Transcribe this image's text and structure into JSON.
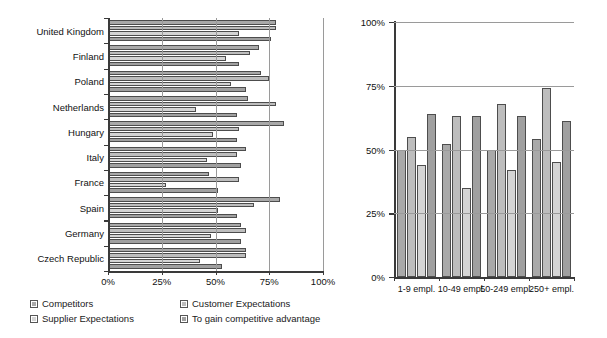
{
  "colors": {
    "series1": "#a9a9a9",
    "series2": "#bdbdbd",
    "series3": "#d4d4d4",
    "series4": "#a0a0a0",
    "axis": "#3a3a3a",
    "grid": "#9a9a9a",
    "border": "#4d4d4d",
    "background": "#ffffff"
  },
  "legend": {
    "items": [
      {
        "label": "Competitors",
        "color": "#a9a9a9",
        "icon": "legend-swatch"
      },
      {
        "label": "Customer Expectations",
        "color": "#bdbdbd",
        "icon": "legend-swatch"
      },
      {
        "label": "Supplier Expectations",
        "color": "#d4d4d4",
        "icon": "legend-swatch"
      },
      {
        "label": "To gain competitive advantage",
        "color": "#a0a0a0",
        "icon": "legend-swatch"
      }
    ]
  },
  "chart_data": [
    {
      "id": "by-country",
      "type": "bar",
      "orientation": "horizontal",
      "title": "",
      "xlabel": "",
      "ylabel": "",
      "xlim": [
        0,
        100
      ],
      "xticks": [
        0,
        25,
        50,
        75,
        100
      ],
      "xticklabels": [
        "0%",
        "25%",
        "50%",
        "75%",
        "100%"
      ],
      "grid": true,
      "legend_position": "bottom",
      "categories": [
        "United Kingdom",
        "Finland",
        "Poland",
        "Netherlands",
        "Hungary",
        "Italy",
        "France",
        "Spain",
        "Germany",
        "Czech Republic"
      ],
      "series": [
        {
          "name": "Competitors",
          "color": "#a9a9a9",
          "values": [
            78,
            70,
            71,
            65,
            82,
            64,
            47,
            80,
            62,
            64
          ]
        },
        {
          "name": "Customer Expectations",
          "color": "#bdbdbd",
          "values": [
            78,
            66,
            75,
            78,
            61,
            60,
            61,
            68,
            64,
            64
          ]
        },
        {
          "name": "Supplier Expectations",
          "color": "#d4d4d4",
          "values": [
            61,
            55,
            57,
            41,
            49,
            46,
            27,
            51,
            48,
            43
          ]
        },
        {
          "name": "To gain competitive advantage",
          "color": "#a0a0a0",
          "values": [
            76,
            61,
            64,
            60,
            60,
            62,
            51,
            60,
            62,
            53
          ]
        }
      ]
    },
    {
      "id": "by-company-size",
      "type": "bar",
      "orientation": "vertical",
      "title": "",
      "xlabel": "",
      "ylabel": "",
      "ylim": [
        0,
        100
      ],
      "yticks": [
        0,
        25,
        50,
        75,
        100
      ],
      "yticklabels": [
        "0%",
        "25%",
        "50%",
        "75%",
        "100%"
      ],
      "grid": true,
      "legend_position": "shared",
      "categories": [
        "1-9 empl.",
        "10-49 empl.",
        "50-249 empl.",
        "250+ empl."
      ],
      "series": [
        {
          "name": "Competitors",
          "color": "#a9a9a9",
          "values": [
            50,
            52,
            50,
            54
          ]
        },
        {
          "name": "Customer Expectations",
          "color": "#bdbdbd",
          "values": [
            55,
            63,
            68,
            74
          ]
        },
        {
          "name": "Supplier Expectations",
          "color": "#d4d4d4",
          "values": [
            44,
            35,
            42,
            45
          ]
        },
        {
          "name": "To gain competitive advantage",
          "color": "#a0a0a0",
          "values": [
            64,
            63,
            63,
            61
          ]
        }
      ]
    }
  ]
}
